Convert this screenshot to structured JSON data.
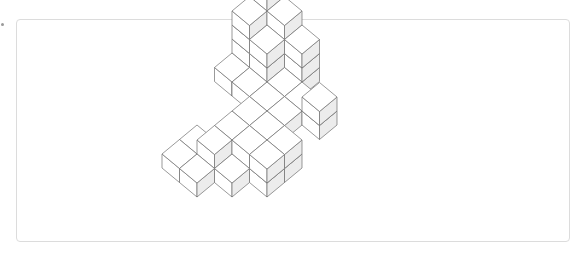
{
  "figure": {
    "projection": {
      "origin": [
        267,
        38
      ],
      "ex": [
        17.5,
        14.5
      ],
      "ey": [
        -17.5,
        14.5
      ],
      "ez": [
        0,
        -14
      ]
    },
    "colors": {
      "top": "#ffffff",
      "left": "#ffffff",
      "right": "#ececec",
      "stroke": "#6e6e6e",
      "frame": "#dcdcdc"
    },
    "cubes": [
      [
        0,
        0,
        4
      ],
      [
        0,
        0,
        3
      ],
      [
        0,
        0,
        2
      ],
      [
        0,
        0,
        1
      ],
      [
        0,
        0,
        0
      ],
      [
        0,
        1,
        3
      ],
      [
        0,
        1,
        2
      ],
      [
        0,
        1,
        1
      ],
      [
        0,
        1,
        0
      ],
      [
        1,
        1,
        2
      ],
      [
        1,
        1,
        1
      ],
      [
        1,
        1,
        0
      ],
      [
        1,
        0,
        3
      ],
      [
        1,
        0,
        2
      ],
      [
        1,
        0,
        1
      ],
      [
        1,
        0,
        0
      ],
      [
        2,
        0,
        2
      ],
      [
        2,
        0,
        1
      ],
      [
        2,
        0,
        0
      ],
      [
        0,
        2,
        0
      ],
      [
        1,
        2,
        0
      ],
      [
        2,
        2,
        0
      ],
      [
        2,
        1,
        0
      ],
      [
        3,
        1,
        0
      ],
      [
        3,
        2,
        0
      ],
      [
        4,
        1,
        1
      ],
      [
        4,
        1,
        0
      ],
      [
        3,
        3,
        0
      ],
      [
        2,
        3,
        0
      ],
      [
        3,
        4,
        0
      ],
      [
        2,
        4,
        0
      ],
      [
        2,
        5,
        0
      ],
      [
        4,
        3,
        0
      ],
      [
        4,
        3,
        -1
      ],
      [
        4,
        4,
        -1
      ],
      [
        4,
        4,
        0
      ],
      [
        1,
        5,
        -1
      ],
      [
        2,
        5,
        -1
      ],
      [
        2,
        6,
        -1
      ],
      [
        3,
        5,
        -1
      ],
      [
        1,
        6,
        -1
      ]
    ]
  }
}
